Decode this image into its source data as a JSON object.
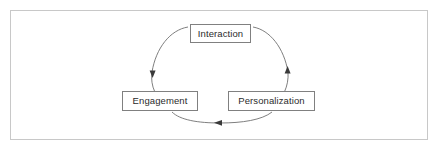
{
  "figure": {
    "background_color": "#ffffff",
    "border_color": "#c8c8c8",
    "stroke_color": "#707070",
    "box_border_color": "#808080",
    "text_color": "#2b2b2b"
  },
  "diagram": {
    "type": "cycle",
    "nodes": [
      {
        "id": "interaction",
        "label": "Interaction",
        "position": "top-center"
      },
      {
        "id": "engagement",
        "label": "Engagement",
        "position": "bottom-left"
      },
      {
        "id": "personalization",
        "label": "Personalization",
        "position": "bottom-right"
      }
    ],
    "edges": [
      {
        "from": "interaction",
        "to": "engagement",
        "side": "left",
        "arrow_direction": "down"
      },
      {
        "from": "personalization",
        "to": "interaction",
        "side": "right",
        "arrow_direction": "up"
      },
      {
        "from": "personalization",
        "to": "engagement",
        "side": "bottom",
        "arrow_direction": "left"
      }
    ],
    "ellipse": {
      "center_x": 220,
      "center_y": 72,
      "radius_x": 68,
      "radius_y": 45
    }
  }
}
